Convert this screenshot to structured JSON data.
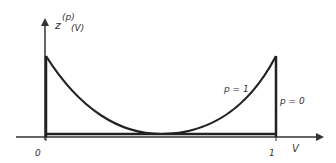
{
  "diagram": {
    "y_axis_label": "z",
    "y_axis_sup": "(p)",
    "y_axis_sub": "(V)",
    "x_axis_label": "V",
    "x_ticks": [
      "0",
      "1"
    ],
    "curve_labels": {
      "p1": "p = 1",
      "p0": "p = 0"
    }
  }
}
